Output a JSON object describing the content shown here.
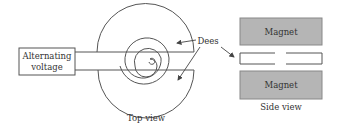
{
  "diagram": {
    "labels": {
      "voltage_line1": "Alternating",
      "voltage_line2": "voltage",
      "dees": "Dees",
      "top_view": "Top view",
      "side_view": "Side view",
      "magnet_top": "Magnet",
      "magnet_bottom": "Magnet"
    },
    "colors": {
      "line": "#555555",
      "magnet_fill": "#b5b5b5",
      "magnet_stroke": "#888888",
      "text": "#333333",
      "background": "#ffffff"
    }
  }
}
